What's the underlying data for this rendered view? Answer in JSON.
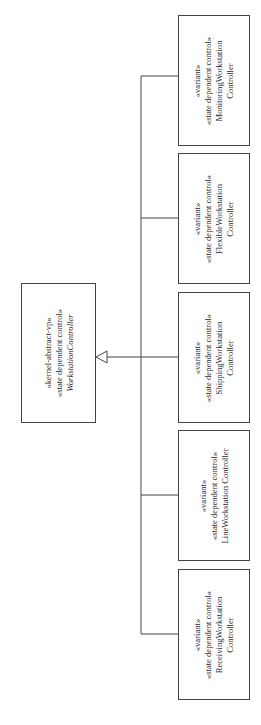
{
  "diagram": {
    "type": "UML class generalization diagram",
    "parent": {
      "stereotypes": [
        "«kernel-abstract-vp»",
        "«state dependent control»"
      ],
      "name": "WorkstationController",
      "name_italic": true
    },
    "children": [
      {
        "stereotypes": [
          "«variant»",
          "«state dependent control»"
        ],
        "name_lines": [
          "MonitoringWorkstation",
          "Controller"
        ]
      },
      {
        "stereotypes": [
          "«variant»",
          "«state dependent control»"
        ],
        "name_lines": [
          "FlexibleWorkstation",
          "Controller"
        ]
      },
      {
        "stereotypes": [
          "«variant»",
          "«state dependent control»"
        ],
        "name_lines": [
          "ShippingWorkstation",
          "Controller"
        ]
      },
      {
        "stereotypes": [
          "«variant»",
          "«state dependent control»"
        ],
        "name_lines": [
          "LineWorkstation Controller"
        ]
      },
      {
        "stereotypes": [
          "«variant»",
          "«state dependent control»"
        ],
        "name_lines": [
          "ReceivingWorkstation",
          "Controller"
        ]
      }
    ],
    "relationship": "generalization (hollow triangle arrow to parent)",
    "colors": {
      "line": "#444444",
      "text": "#2a2a2a",
      "background": "#ffffff"
    }
  }
}
